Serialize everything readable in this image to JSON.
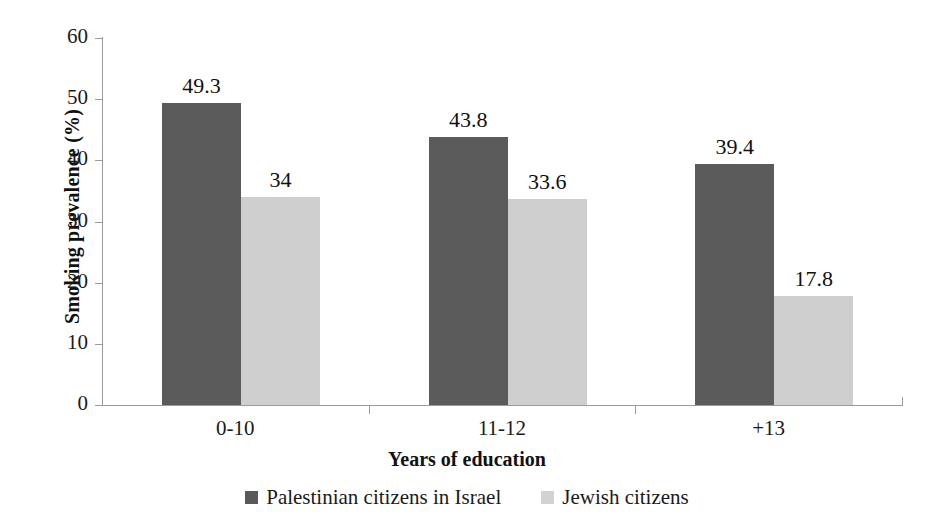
{
  "chart_data": {
    "type": "bar",
    "title": "",
    "subtitle": "",
    "xlabel": "Years of education",
    "ylabel": "Smoking prevalence (%)",
    "categories": [
      "0-10",
      "11-12",
      "+13"
    ],
    "series": [
      {
        "name": "Palestinian citizens in Israel",
        "color": "#595959",
        "values": [
          49.3,
          43.8,
          39.4
        ],
        "labels": [
          "49.3",
          "43.8",
          "39.4"
        ]
      },
      {
        "name": "Jewish citizens",
        "color": "#d2d2d2",
        "values": [
          34,
          33.6,
          17.8
        ],
        "labels": [
          "34",
          "33.6",
          "17.8"
        ]
      }
    ],
    "ylim": [
      0,
      60
    ],
    "yticks": [
      0,
      10,
      20,
      30,
      40,
      50,
      60
    ],
    "ytick_labels": [
      "0",
      "10",
      "20",
      "30",
      "40",
      "50",
      "60"
    ],
    "grid": false,
    "legend_position": "bottom",
    "data_labels_shown": true
  },
  "axes": {
    "y_title": "Smoking prevalence (%)",
    "x_title": "Years of education"
  },
  "legend": {
    "items": [
      {
        "label": "Palestinian citizens in Israel",
        "swatch": "series-0"
      },
      {
        "label": "Jewish citizens",
        "swatch": "series-1"
      }
    ]
  }
}
